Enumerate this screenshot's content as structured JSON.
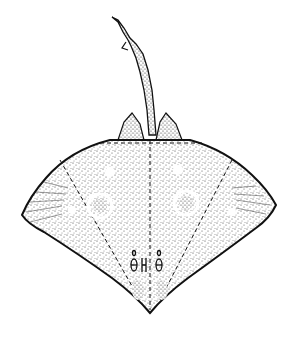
{
  "figure": {
    "subject": "skate / ray, dorsal view",
    "style": "stippled black-and-white scientific illustration",
    "colors": {
      "ink": "#111111",
      "stipple": "#3a3a3a",
      "paper": "#ffffff"
    }
  }
}
